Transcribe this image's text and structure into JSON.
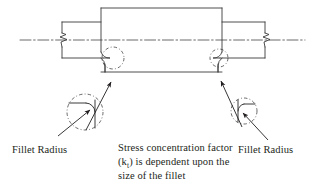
{
  "figure": {
    "stroke_color": "#3a3a3a",
    "text_color": "#231f20",
    "background_color": "#ffffff"
  },
  "labels": {
    "fillet_left": "Fillet Radius",
    "fillet_right": "Fillet Radius",
    "note_line_1": "Stress concentration factor",
    "note_line_2_pre": "(k",
    "note_line_2_sub": "t",
    "note_line_2_post": ") is dependent upon the",
    "note_line_3": "size of the fillet"
  },
  "geometry": {
    "shaft_small_top_y": 22,
    "shaft_small_bottom_y": 58,
    "boss_left_x": 101,
    "boss_right_x": 222,
    "boss_top_y": 8,
    "boss_bottom_y": 72,
    "centerline_y": 40,
    "shaft_left_end_x": 62,
    "shaft_right_end_x": 265,
    "break_left_x": 75,
    "break_right_x": 252,
    "detail_circle_left": {
      "cx": 113,
      "cy": 58,
      "r": 11
    },
    "detail_circle_right": {
      "cx": 219,
      "cy": 58,
      "r": 9
    },
    "blowup_circle_left": {
      "cx": 85,
      "cy": 112,
      "r": 18
    },
    "blowup_circle_right": {
      "cx": 244,
      "cy": 111,
      "r": 13
    }
  },
  "annotations": {
    "icon_detail_left": "detail-circle-icon",
    "icon_detail_right": "detail-circle-icon",
    "icon_break_left": "break-line-icon",
    "icon_break_right": "break-line-icon",
    "icon_centerline": "centerline-icon",
    "leader_left": "leader-arrow-icon",
    "leader_right": "leader-arrow-icon",
    "leader_fillet_left": "leader-arrow-icon",
    "leader_fillet_right": "leader-arrow-icon"
  }
}
